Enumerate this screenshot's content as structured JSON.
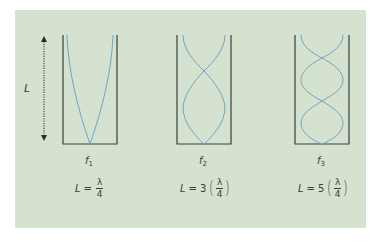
{
  "figure": {
    "length_label": "L",
    "colors": {
      "background": "#d4e2cf",
      "wave": "#6fa6c6",
      "tube": "#3a3f3a",
      "text": "#3a3f3a"
    },
    "tubes": [
      {
        "frequency_symbol": "f",
        "frequency_subscript": "1",
        "harmonic": 1,
        "equation": {
          "lhs": "L",
          "equals": "=",
          "coefficient": "",
          "numerator": "λ",
          "denominator": "4",
          "parenthesized": false
        }
      },
      {
        "frequency_symbol": "f",
        "frequency_subscript": "2",
        "harmonic": 3,
        "equation": {
          "lhs": "L",
          "equals": "=",
          "coefficient": "3",
          "numerator": "λ",
          "denominator": "4",
          "parenthesized": true
        }
      },
      {
        "frequency_symbol": "f",
        "frequency_subscript": "3",
        "harmonic": 5,
        "equation": {
          "lhs": "L",
          "equals": "=",
          "coefficient": "5",
          "numerator": "λ",
          "denominator": "4",
          "parenthesized": true
        }
      }
    ],
    "paren_open": "(",
    "paren_close": ")"
  }
}
